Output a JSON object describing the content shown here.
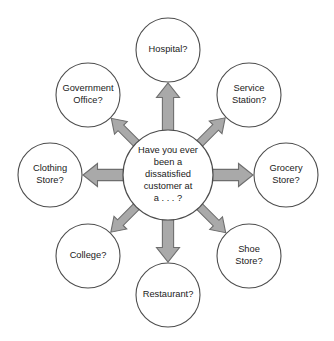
{
  "diagram": {
    "type": "spider-web-brainstorm",
    "background_color": "#ffffff",
    "hub": {
      "name": "center-question-node",
      "lines": [
        "Have you ever",
        "been a",
        "dissatisfied",
        "customer at",
        "a . . . ?"
      ],
      "full_text": "Have you ever been a dissatisfied customer at a . . . ?",
      "center_x": 168,
      "center_y": 175,
      "radius": 45,
      "fill_color": "#ffffff",
      "stroke_color": "#4d4d4d"
    },
    "arrow_style": {
      "fill_color": "#a9a9a9",
      "stroke_color": "#6e6e6e",
      "direction": "outward-from-hub"
    },
    "nodes": [
      {
        "id": "hospital",
        "name": "node-hospital",
        "lines": [
          "Hospital?"
        ],
        "full_text": "Hospital?",
        "center_x": 168,
        "center_y": 50,
        "radius": 32,
        "angle_deg": 270,
        "position": "top"
      },
      {
        "id": "service-station",
        "name": "node-service-station",
        "lines": [
          "Service",
          "Station?"
        ],
        "full_text": "Service Station?",
        "center_x": 249,
        "center_y": 95,
        "radius": 32,
        "angle_deg": 315,
        "position": "top-right"
      },
      {
        "id": "grocery-store",
        "name": "node-grocery-store",
        "lines": [
          "Grocery",
          "Store?"
        ],
        "full_text": "Grocery Store?",
        "center_x": 286,
        "center_y": 175,
        "radius": 32,
        "angle_deg": 0,
        "position": "right"
      },
      {
        "id": "shoe-store",
        "name": "node-shoe-store",
        "lines": [
          "Shoe",
          "Store?"
        ],
        "full_text": "Shoe Store?",
        "center_x": 249,
        "center_y": 256,
        "radius": 32,
        "angle_deg": 45,
        "position": "bottom-right"
      },
      {
        "id": "restaurant",
        "name": "node-restaurant",
        "lines": [
          "Restaurant?"
        ],
        "full_text": "Restaurant?",
        "center_x": 168,
        "center_y": 295,
        "radius": 32,
        "angle_deg": 90,
        "position": "bottom"
      },
      {
        "id": "college",
        "name": "node-college",
        "lines": [
          "College?"
        ],
        "full_text": "College?",
        "center_x": 88,
        "center_y": 256,
        "radius": 32,
        "angle_deg": 135,
        "position": "bottom-left"
      },
      {
        "id": "clothing-store",
        "name": "node-clothing-store",
        "lines": [
          "Clothing",
          "Store?"
        ],
        "full_text": "Clothing Store?",
        "center_x": 50,
        "center_y": 175,
        "radius": 32,
        "angle_deg": 180,
        "position": "left"
      },
      {
        "id": "government-office",
        "name": "node-government-office",
        "lines": [
          "Government",
          "Office?"
        ],
        "full_text": "Government Office?",
        "center_x": 88,
        "center_y": 95,
        "radius": 32,
        "angle_deg": 225,
        "position": "top-left"
      }
    ]
  }
}
